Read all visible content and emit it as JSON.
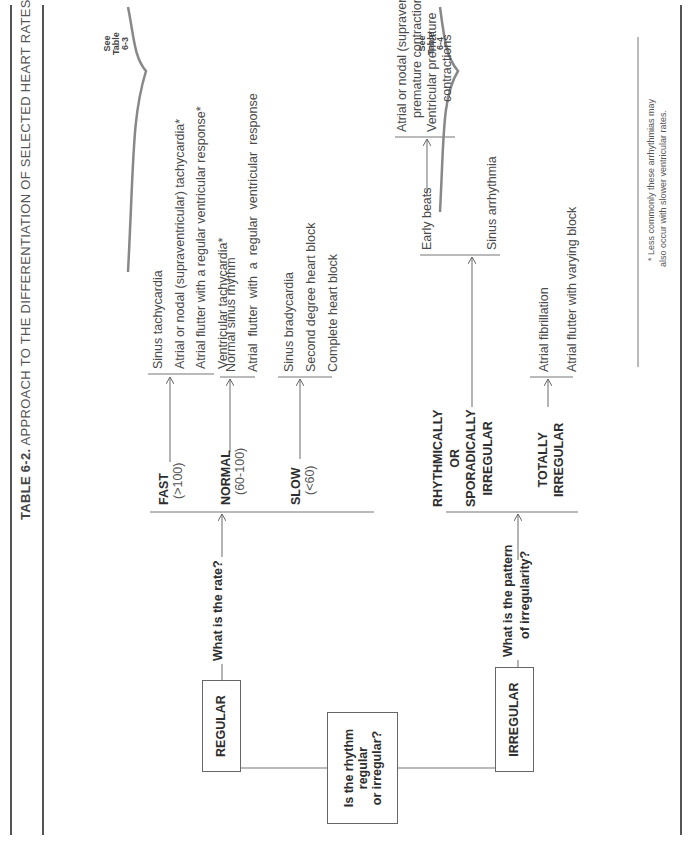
{
  "title": {
    "table_number": "TABLE 6-2.",
    "text": "APPROACH TO THE DIFFERENTIATION OF SELECTED HEART RATES AND RHYTHMS"
  },
  "root_question": {
    "line1": "Is the rhythm",
    "line2": "regular",
    "line3": "or irregular?"
  },
  "regular": {
    "label": "REGULAR",
    "question": "What is the rate?",
    "branches": [
      {
        "label": "FAST",
        "range": "(>100)",
        "outcomes": [
          "Sinus tachycardia",
          "Atrial or nodal (supraventricular) tachycardia*",
          "Atrial flutter with a regular ventricular response*",
          "Ventricular tachycardia*"
        ]
      },
      {
        "label": "NORMAL",
        "range": "(60-100)",
        "outcomes": [
          "Normal sinus rhythm",
          "Atrial  flutter  with  a  regular  ventricular  response"
        ]
      },
      {
        "label": "SLOW",
        "range": "(<60)",
        "outcomes": [
          "Sinus bradycardia",
          "Second degree heart block",
          "Complete heart block"
        ]
      }
    ],
    "see_table": {
      "line1": "See",
      "line2": "Table",
      "line3": "6-3"
    }
  },
  "irregular": {
    "label": "IRREGULAR",
    "question_line1": "What is the pattern",
    "question_line2": "of irregularity?",
    "branches": [
      {
        "label_line1": "RHYTHMICALLY",
        "label_line2": "OR",
        "label_line3": "SPORADICALLY",
        "label_line4": "IRREGULAR",
        "sub_label": "Early beats",
        "early_beats_outcomes": [
          {
            "line1": "Atrial or nodal (supraventricular)",
            "line2": "premature contractions"
          },
          {
            "line1": "Ventricular premature",
            "line2": "contractions"
          }
        ],
        "other_outcome": "Sinus arrhythmia"
      },
      {
        "label_line1": "TOTALLY",
        "label_line2": "IRREGULAR",
        "outcomes": [
          "Atrial fibrillation",
          "Atrial flutter with varying block"
        ]
      }
    ],
    "see_table": {
      "line1": "See",
      "line2": "Table",
      "line3": "6-4"
    }
  },
  "footnote": {
    "line1": "* Less commonly these arrhythmias may",
    "line2": "also occur with slower ventricular rates."
  }
}
